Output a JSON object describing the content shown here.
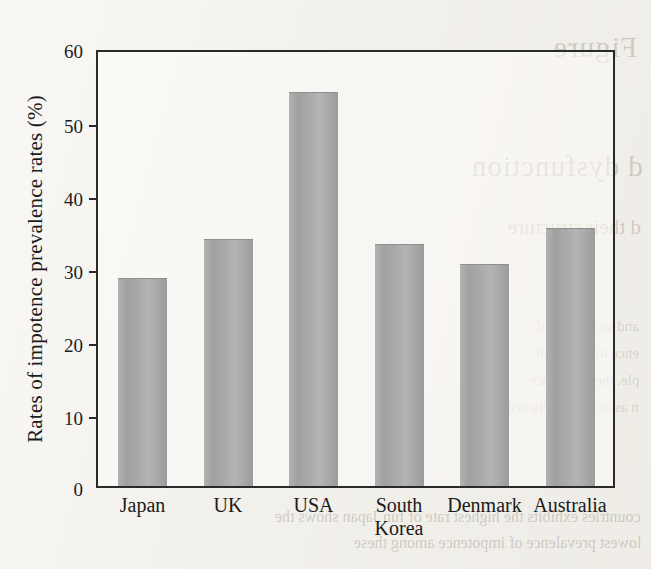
{
  "page": {
    "background_color": "#f2f0eb",
    "bleed_through_text": [
      "Figure",
      "d dysfunction",
      "d their structure",
      "and so on. one of",
      "ence in men with",
      "ple, the impotence",
      "n association between",
      "countries exhibits the highest rate of fun Japan shows the",
      "lowest prevalence of impotence among these"
    ]
  },
  "chart_data": {
    "type": "bar",
    "title": "",
    "xlabel": "",
    "ylabel": "Rates of impotence prevalence rates (%)",
    "categories": [
      "Japan",
      "UK",
      "USA",
      "South\nKorea",
      "Denmark",
      "Australia"
    ],
    "values": [
      28.5,
      33.8,
      54.0,
      33.2,
      30.4,
      35.3
    ],
    "ylim": [
      0,
      60
    ],
    "yticks": [
      0,
      10,
      20,
      30,
      40,
      50,
      60
    ],
    "ytick_labels": [
      "0",
      "10",
      "20",
      "30",
      "40",
      "50",
      "60"
    ],
    "grid": false,
    "legend": null,
    "bar_color": "#a8a8a8",
    "frame_color": "#2a2a2a"
  }
}
